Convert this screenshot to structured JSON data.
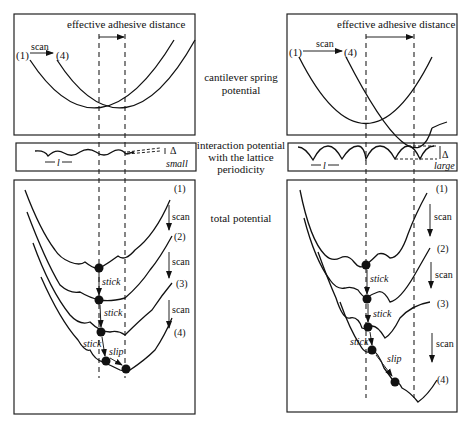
{
  "diagram": {
    "row_labels": {
      "top": [
        "cantilever spring",
        "potential"
      ],
      "middle": [
        "interaction potential",
        "with the lattice",
        "periodicity"
      ],
      "bottom": [
        "total potential"
      ]
    },
    "left_panel": {
      "header": "effective adhesive distance",
      "scan_label": "scan",
      "start_label": "(1)",
      "end_label": "(4)",
      "period_label": "l",
      "delta_label": "Δ",
      "amplitude_label": "small",
      "curve_labels": [
        "(1)",
        "(2)",
        "(3)",
        "(4)"
      ],
      "scan_arrows": [
        "scan",
        "scan",
        "scan"
      ],
      "annotations": [
        "stick",
        "stick",
        "stick",
        "slip"
      ]
    },
    "right_panel": {
      "header": "effective adhesive distance",
      "scan_label": "scan",
      "start_label": "(1)",
      "end_label": "(4)",
      "period_label": "l",
      "delta_label": "Δ",
      "amplitude_label": "large",
      "curve_labels": [
        "(1)",
        "(2)",
        "(3)",
        "(4)"
      ],
      "scan_arrows": [
        "scan",
        "scan",
        "scan"
      ],
      "annotations": [
        "stick",
        "stick",
        "stick",
        "slip"
      ]
    }
  }
}
